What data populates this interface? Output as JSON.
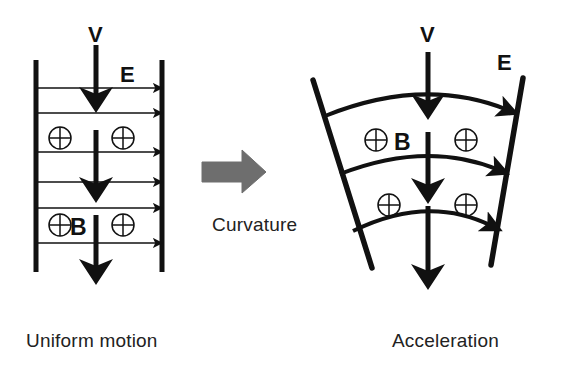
{
  "figure": {
    "background_color": "#ffffff",
    "stroke_color": "#111111",
    "arrow_fill": "#6e6e6e",
    "width": 576,
    "height": 374
  },
  "captions": {
    "left": "Uniform motion",
    "middle": "Curvature",
    "right": "Acceleration"
  },
  "panels": [
    {
      "id": "uniform",
      "name": "uniform-motion-panel",
      "caption": "Uniform motion",
      "labels": {
        "velocity": "V",
        "efield": "E",
        "bfield": "B"
      },
      "plates": [
        {
          "name": "left-plate",
          "x1": 36,
          "y1": 60,
          "x2": 36,
          "y2": 272
        },
        {
          "name": "right-plate",
          "x1": 162,
          "y1": 60,
          "x2": 162,
          "y2": 272
        }
      ],
      "efield_arrows_y": [
        88,
        113,
        152,
        182,
        208,
        243
      ],
      "efield_arrow_x1": 38,
      "efield_arrow_x2": 162,
      "velocity_arrows": [
        {
          "x": 96,
          "y1": 45,
          "y2": 105
        },
        {
          "x": 96,
          "y1": 130,
          "y2": 195
        },
        {
          "x": 96,
          "y1": 215,
          "y2": 277
        }
      ],
      "charges": [
        {
          "cx": 60,
          "cy": 138
        },
        {
          "cx": 123,
          "cy": 138
        },
        {
          "cx": 60,
          "cy": 225
        },
        {
          "cx": 123,
          "cy": 225
        }
      ],
      "label_positions": {
        "velocity": {
          "x": 88,
          "y": 40
        },
        "efield": {
          "x": 121,
          "y": 78
        },
        "bfield": {
          "x": 72,
          "y": 234
        }
      }
    },
    {
      "id": "acceleration",
      "name": "acceleration-panel",
      "caption": "Acceleration",
      "labels": {
        "velocity": "V",
        "efield": "E",
        "bfield": "B"
      },
      "plates": [
        {
          "name": "left-plate",
          "x1": 313,
          "y1": 80,
          "x2": 372,
          "y2": 268
        },
        {
          "name": "right-plate",
          "x1": 523,
          "y1": 78,
          "x2": 491,
          "y2": 265
        }
      ],
      "curved_efield_arrows": [
        {
          "x1": 327,
          "y1": 117,
          "cx": 424,
          "cy": 78,
          "x2": 513,
          "y2": 112
        },
        {
          "x1": 342,
          "y1": 175,
          "cx": 427,
          "cy": 142,
          "x2": 504,
          "y2": 172
        },
        {
          "x1": 355,
          "y1": 232,
          "cx": 428,
          "cy": 196,
          "x2": 497,
          "y2": 228
        }
      ],
      "velocity_arrows": [
        {
          "x": 428,
          "y1": 52,
          "y2": 112
        },
        {
          "x": 428,
          "y1": 132,
          "y2": 196
        },
        {
          "x": 428,
          "y1": 208,
          "y2": 282
        }
      ],
      "charges": [
        {
          "cx": 376,
          "cy": 140
        },
        {
          "cx": 466,
          "cy": 140
        },
        {
          "cx": 389,
          "cy": 205
        },
        {
          "cx": 466,
          "cy": 205
        }
      ],
      "label_positions": {
        "velocity": {
          "x": 420,
          "y": 40
        },
        "efield": {
          "x": 498,
          "y": 66
        },
        "bfield": {
          "x": 394,
          "y": 148
        }
      }
    }
  ],
  "transition_arrow": {
    "name": "curvature-arrow",
    "label": "Curvature",
    "x": 202,
    "y": 150,
    "width": 64,
    "height": 44,
    "fill": "#6e6e6e"
  }
}
